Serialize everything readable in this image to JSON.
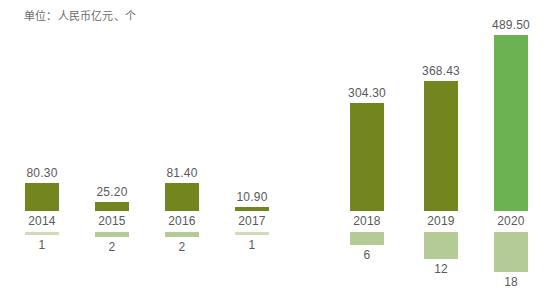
{
  "unit_note": "单位：人民币亿元、个",
  "colors": {
    "bar_olive": "#72851f",
    "bar_green": "#6cb252",
    "count_sage": "#b5cb96",
    "count_sage_pale": "#cfdcb7",
    "text": "#59595b",
    "note_text": "#6b6b6b",
    "background": "#ffffff"
  },
  "chart_data": {
    "type": "bar",
    "title": "",
    "subtitle": "",
    "xlabel": "",
    "ylabel": "",
    "note": "单位：人民币亿元、个",
    "grid": false,
    "legend": "none",
    "categories": [
      "2014",
      "2015",
      "2016",
      "2017",
      "2018",
      "2019",
      "2020"
    ],
    "series": [
      {
        "name": "金额（人民币亿元）",
        "values": [
          80.3,
          25.2,
          81.4,
          10.9,
          304.3,
          368.43,
          489.5
        ],
        "value_labels": [
          "80.30",
          "25.20",
          "81.40",
          "10.90",
          "304.30",
          "368.43",
          "489.50"
        ],
        "ylim": [
          0,
          489.5
        ]
      },
      {
        "name": "数量（个）",
        "values": [
          1,
          2,
          2,
          1,
          6,
          12,
          18
        ],
        "value_labels": [
          "1",
          "2",
          "2",
          "1",
          "6",
          "12",
          "18"
        ],
        "ylim": [
          0,
          18
        ]
      }
    ]
  },
  "columns": [
    {
      "year": "2014",
      "value_label": "80.30",
      "count_label": "1",
      "bar_height_px": 28,
      "bar_color": "#72851f",
      "count_height_px": 3,
      "count_color": "#cfdcb7",
      "left_px": 7
    },
    {
      "year": "2015",
      "value_label": "25.20",
      "count_label": "2",
      "bar_height_px": 9,
      "bar_color": "#72851f",
      "count_height_px": 5,
      "count_color": "#b5cb96",
      "left_px": 77
    },
    {
      "year": "2016",
      "value_label": "81.40",
      "count_label": "2",
      "bar_height_px": 28,
      "bar_color": "#72851f",
      "count_height_px": 5,
      "count_color": "#b5cb96",
      "left_px": 147
    },
    {
      "year": "2017",
      "value_label": "10.90",
      "count_label": "1",
      "bar_height_px": 4,
      "bar_color": "#72851f",
      "count_height_px": 3,
      "count_color": "#cfdcb7",
      "left_px": 217
    },
    {
      "year": "2018",
      "value_label": "304.30",
      "count_label": "6",
      "bar_height_px": 108,
      "bar_color": "#72851f",
      "count_height_px": 13,
      "count_color": "#b5cb96",
      "left_px": 332
    },
    {
      "year": "2019",
      "value_label": "368.43",
      "count_label": "12",
      "bar_height_px": 130,
      "bar_color": "#72851f",
      "count_height_px": 27,
      "count_color": "#b5cb96",
      "left_px": 406
    },
    {
      "year": "2020",
      "value_label": "489.50",
      "count_label": "18",
      "bar_height_px": 176,
      "bar_color": "#6cb252",
      "count_height_px": 40,
      "count_color": "#b5cb96",
      "left_px": 476
    }
  ]
}
